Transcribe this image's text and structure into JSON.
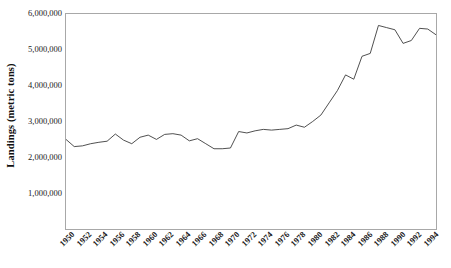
{
  "chart_data": {
    "type": "line",
    "title": "",
    "xlabel": "",
    "ylabel": "Landings (metric tons)",
    "ylim": [
      0,
      6000000
    ],
    "xlim": [
      1950,
      1995
    ],
    "grid": false,
    "legend": false,
    "line_color": "#3a3a3a",
    "axis_color": "#a8a8a8",
    "y_ticks": [
      {
        "value": 6000000,
        "label": "6,000,000"
      },
      {
        "value": 5000000,
        "label": "5,000,000"
      },
      {
        "value": 4000000,
        "label": "4,000,000"
      },
      {
        "value": 3000000,
        "label": "3,000,000"
      },
      {
        "value": 2000000,
        "label": "2,000,000"
      },
      {
        "value": 1000000,
        "label": "1,000,000"
      }
    ],
    "x_ticks": [
      {
        "value": 1950,
        "label": "1950"
      },
      {
        "value": 1952,
        "label": "1952"
      },
      {
        "value": 1954,
        "label": "1954"
      },
      {
        "value": 1956,
        "label": "1956"
      },
      {
        "value": 1958,
        "label": "1958"
      },
      {
        "value": 1960,
        "label": "1960"
      },
      {
        "value": 1962,
        "label": "1962"
      },
      {
        "value": 1964,
        "label": "1964"
      },
      {
        "value": 1966,
        "label": "1966"
      },
      {
        "value": 1968,
        "label": "1968"
      },
      {
        "value": 1970,
        "label": "1970"
      },
      {
        "value": 1972,
        "label": "1972"
      },
      {
        "value": 1974,
        "label": "1974"
      },
      {
        "value": 1976,
        "label": "1976"
      },
      {
        "value": 1978,
        "label": "1978"
      },
      {
        "value": 1980,
        "label": "1980"
      },
      {
        "value": 1982,
        "label": "1982"
      },
      {
        "value": 1984,
        "label": "1984"
      },
      {
        "value": 1986,
        "label": "1986"
      },
      {
        "value": 1988,
        "label": "1988"
      },
      {
        "value": 1990,
        "label": "1990"
      },
      {
        "value": 1992,
        "label": "1992"
      },
      {
        "value": 1994,
        "label": "1994"
      }
    ],
    "x": [
      1950,
      1951,
      1952,
      1953,
      1954,
      1955,
      1956,
      1957,
      1958,
      1959,
      1960,
      1961,
      1962,
      1963,
      1964,
      1965,
      1966,
      1967,
      1968,
      1969,
      1970,
      1971,
      1972,
      1973,
      1974,
      1975,
      1976,
      1977,
      1978,
      1979,
      1980,
      1981,
      1982,
      1983,
      1984,
      1985,
      1986,
      1987,
      1988,
      1989,
      1990,
      1991,
      1992,
      1993,
      1994,
      1995
    ],
    "series": [
      {
        "name": "Landings",
        "values": [
          2500000,
          2300000,
          2320000,
          2380000,
          2420000,
          2450000,
          2650000,
          2480000,
          2380000,
          2560000,
          2620000,
          2500000,
          2640000,
          2660000,
          2620000,
          2460000,
          2520000,
          2380000,
          2240000,
          2240000,
          2260000,
          2720000,
          2680000,
          2740000,
          2780000,
          2760000,
          2780000,
          2800000,
          2900000,
          2840000,
          3000000,
          3180000,
          3520000,
          3860000,
          4300000,
          4180000,
          4820000,
          4900000,
          5680000,
          5620000,
          5560000,
          5180000,
          5260000,
          5600000,
          5580000,
          5420000
        ]
      }
    ]
  }
}
